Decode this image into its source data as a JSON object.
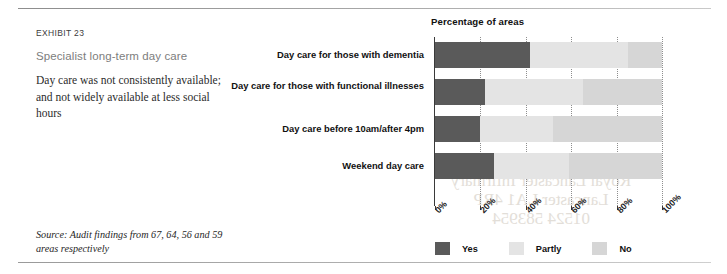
{
  "exhibit": {
    "number": "EXHIBIT 23",
    "title": "Specialist long-term day care",
    "description": "Day care was not consistently available; and not widely available at less social hours",
    "source": "Source: Audit findings from 67, 64, 56 and 59 areas respectively"
  },
  "watermark": {
    "line1": "Education Centre",
    "line2": "Royal Lancaster Infirmary",
    "line3": "Lancaster LA1 4RP",
    "line4": "01524 583954"
  },
  "colors": {
    "yes": "#5a5a5a",
    "partly": "#e4e4e4",
    "no": "#d6d6d6",
    "axis": "#3a3a3a",
    "grid": "#8e8e8e",
    "rule": "#9a9a9a",
    "title_grey": "#7d7d7d"
  },
  "chart_data": {
    "type": "bar",
    "orientation": "horizontal",
    "stacked": true,
    "title": "Percentage of areas",
    "xlabel": "",
    "ylabel": "",
    "xlim": [
      0,
      100
    ],
    "grid": true,
    "legend_position": "bottom",
    "tick_labels": [
      "0%",
      "20%",
      "40%",
      "60%",
      "80%",
      "100%"
    ],
    "tick_values": [
      0,
      20,
      40,
      60,
      80,
      100
    ],
    "categories": [
      "Day care for those with dementia",
      "Day care for those with functional illnesses",
      "Day care before 10am/after 4pm",
      "Weekend day care"
    ],
    "series": [
      {
        "name": "Yes",
        "values": [
          42,
          22,
          20,
          26
        ]
      },
      {
        "name": "Partly",
        "values": [
          43,
          43,
          32,
          33
        ]
      },
      {
        "name": "No",
        "values": [
          15,
          35,
          48,
          41
        ]
      }
    ]
  }
}
